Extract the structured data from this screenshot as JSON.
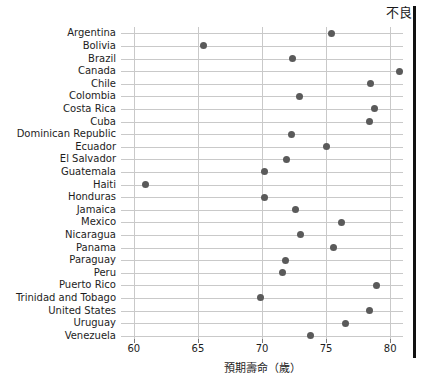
{
  "figure": {
    "annotation_top_right": "不良",
    "xlabel": "預期壽命（歲）",
    "ylabel": ""
  },
  "chart_data": {
    "type": "scatter",
    "title": "",
    "subtitle": "",
    "xlabel": "預期壽命（歲）",
    "ylabel": "",
    "xlim": [
      59.0,
      81.0
    ],
    "xticks": [
      60,
      65,
      70,
      75,
      80
    ],
    "xtick_labels": [
      "60",
      "65",
      "70",
      "75",
      "80"
    ],
    "grid": "both",
    "legend": "none",
    "annotations": [
      {
        "text": "不良",
        "position": "top-right"
      }
    ],
    "marker": {
      "shape": "circle",
      "color": "#5a5a5a",
      "size": 7
    },
    "categories": [
      "Argentina",
      "Bolivia",
      "Brazil",
      "Canada",
      "Chile",
      "Colombia",
      "Costa Rica",
      "Cuba",
      "Dominican Republic",
      "Ecuador",
      "El Salvador",
      "Guatemala",
      "Haiti",
      "Honduras",
      "Jamaica",
      "Mexico",
      "Nicaragua",
      "Panama",
      "Paraguay",
      "Peru",
      "Puerto Rico",
      "Trinidad and Tobago",
      "United States",
      "Uruguay",
      "Venezuela"
    ],
    "values": [
      75.4,
      65.4,
      72.4,
      80.7,
      78.5,
      72.9,
      78.8,
      78.4,
      72.3,
      75.0,
      71.9,
      70.2,
      60.9,
      70.2,
      72.6,
      76.2,
      73.0,
      75.6,
      71.8,
      71.6,
      78.9,
      69.9,
      78.4,
      76.5,
      73.8
    ]
  }
}
